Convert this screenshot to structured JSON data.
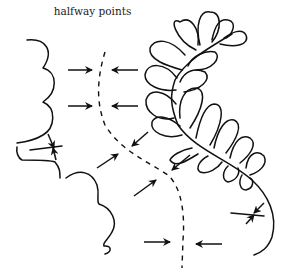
{
  "diagram": {
    "label": "halfway points",
    "elements": {
      "left_scallop_line": "scalloped-line",
      "right_feather": "feather-plume",
      "center_line": "dashed-halfway-line",
      "arrows": [
        "arrow-pair-1",
        "arrow-pair-2",
        "arrow-pair-3",
        "arrow-pair-4",
        "arrow-pair-5",
        "arrow-pair-6",
        "arrow-pair-7"
      ]
    },
    "colors": {
      "line": "#111111",
      "background": "#ffffff"
    }
  }
}
